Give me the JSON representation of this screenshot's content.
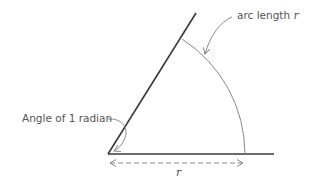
{
  "diagram": {
    "labels": {
      "arc_length_prefix": "arc length ",
      "arc_length_var": "r",
      "angle": "Angle of 1 radian",
      "radius_var": "r"
    },
    "geometry": {
      "vertex": [
        108,
        154
      ],
      "radius_px": 137,
      "angle_rad": 1,
      "baseline_end": [
        274,
        154
      ],
      "ray_end": [
        196,
        13
      ]
    },
    "colors": {
      "lines": "#3a3a3a",
      "arc": "#888888",
      "text": "#555555",
      "annotation": "#8a8a8a"
    }
  }
}
